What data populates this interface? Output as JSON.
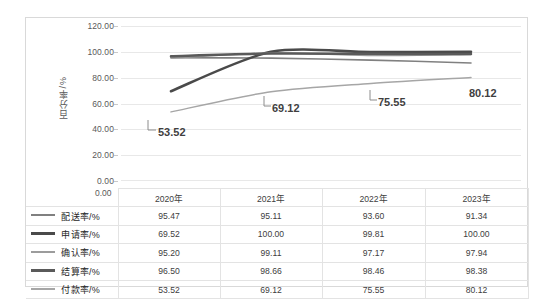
{
  "chart_data": {
    "type": "line",
    "title": "",
    "xlabel": "",
    "ylabel": "百分率/%",
    "ylim": [
      0,
      120
    ],
    "ytick_labels": [
      "120.00",
      "100.00",
      "80.00",
      "60.00",
      "40.00",
      "20.00",
      "0.00"
    ],
    "ytick_values": [
      120,
      100,
      80,
      60,
      40,
      20,
      0
    ],
    "grid": true,
    "legend_position": "data-table-left",
    "smooth": true,
    "categories": [
      "2020年",
      "2021年",
      "2022年",
      "2023年"
    ],
    "series": [
      {
        "name": "配送率/%",
        "values": [
          95.47,
          95.11,
          93.6,
          91.34
        ],
        "color": "#808080",
        "width": 1.6
      },
      {
        "name": "申请率/%",
        "values": [
          69.52,
          100.0,
          99.81,
          100.0
        ],
        "color": "#4a4a4a",
        "width": 2.6
      },
      {
        "name": "确认率/%",
        "values": [
          95.2,
          99.11,
          97.17,
          97.94
        ],
        "color": "#9c9c9c",
        "width": 1.5
      },
      {
        "name": "结算率/%",
        "values": [
          96.5,
          98.66,
          98.46,
          98.38
        ],
        "color": "#5a5a5a",
        "width": 2.5
      },
      {
        "name": "付款率/%",
        "values": [
          53.52,
          69.12,
          75.55,
          80.12
        ],
        "color": "#a6a6a6",
        "width": 1.5
      }
    ],
    "data_labels": {
      "series": "付款率/%",
      "values": [
        "53.52",
        "69.12",
        "75.55",
        "80.12"
      ]
    },
    "table": {
      "column_headers": [
        "2020年",
        "2021年",
        "2022年",
        "2023年"
      ],
      "rows": [
        {
          "label": "配送率/%",
          "cells": [
            "95.47",
            "95.11",
            "93.60",
            "91.34"
          ]
        },
        {
          "label": "申请率/%",
          "cells": [
            "69.52",
            "100.00",
            "99.81",
            "100.00"
          ]
        },
        {
          "label": "确认率/%",
          "cells": [
            "95.20",
            "99.11",
            "97.17",
            "97.94"
          ]
        },
        {
          "label": "结算率/%",
          "cells": [
            "96.50",
            "98.66",
            "98.46",
            "98.38"
          ]
        },
        {
          "label": "付款率/%",
          "cells": [
            "53.52",
            "69.12",
            "75.55",
            "80.12"
          ]
        }
      ]
    }
  },
  "axis": {
    "t120": "120.00",
    "t100": "100.00",
    "t80": "80.00",
    "t60": "60.00",
    "t40": "40.00",
    "t20": "20.00",
    "t0": "0.00",
    "title": "百分率/%"
  },
  "labels": {
    "l1": "53.52",
    "l2": "69.12",
    "l3": "75.55",
    "l4": "80.12"
  },
  "table": {
    "h1": "2020年",
    "h2": "2021年",
    "h3": "2022年",
    "h4": "2023年",
    "r1": {
      "name": "配送率/%",
      "c1": "95.47",
      "c2": "95.11",
      "c3": "93.60",
      "c4": "91.34"
    },
    "r2": {
      "name": "申请率/%",
      "c1": "69.52",
      "c2": "100.00",
      "c3": "99.81",
      "c4": "100.00"
    },
    "r3": {
      "name": "确认率/%",
      "c1": "95.20",
      "c2": "99.11",
      "c3": "97.17",
      "c4": "97.94"
    },
    "r4": {
      "name": "结算率/%",
      "c1": "96.50",
      "c2": "98.66",
      "c3": "98.46",
      "c4": "98.38"
    },
    "r5": {
      "name": "付款率/%",
      "c1": "53.52",
      "c2": "69.12",
      "c3": "75.55",
      "c4": "80.12"
    }
  }
}
